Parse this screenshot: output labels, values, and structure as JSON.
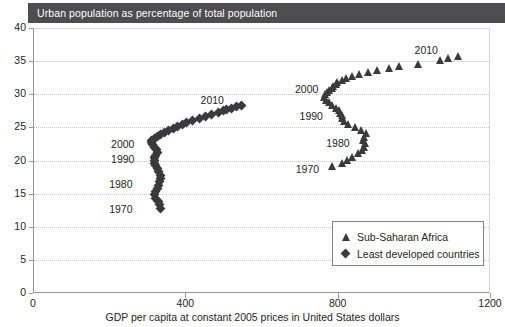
{
  "title_bar": {
    "text": "Urban population as percentage of total population"
  },
  "axis_x_title": "GDP per capita at constant 2005 prices in United States dollars",
  "legend": {
    "items": [
      {
        "symbol": "triangle-marker",
        "label": "Sub-Saharan Africa"
      },
      {
        "symbol": "diamond-marker",
        "label": "Least developed countries"
      }
    ]
  },
  "annotations": {
    "ldc": [
      {
        "label": "2010"
      },
      {
        "label": "2000"
      },
      {
        "label": "1990"
      },
      {
        "label": "1980"
      },
      {
        "label": "1970"
      }
    ],
    "ssa": [
      {
        "label": "2010"
      },
      {
        "label": "2000"
      },
      {
        "label": "1990"
      },
      {
        "label": "1980"
      },
      {
        "label": "1970"
      }
    ]
  },
  "ticks": {
    "y": [
      "0",
      "5",
      "10",
      "15",
      "20",
      "25",
      "30",
      "35",
      "40"
    ],
    "x": [
      "0",
      "400",
      "800",
      "1200"
    ]
  },
  "colors": {
    "title_bar_bg": "#4d4d4f",
    "title_bar_fg": "#ffffff",
    "marker": "#3a3a3c",
    "axis": "#939598",
    "gridline": "#c7c7c7",
    "legend_border": "#808285",
    "plot_bg": "#ffffff"
  },
  "chart_data": {
    "type": "scatter",
    "title": "Urban population as percentage of total population",
    "xlabel": "GDP per capita at constant 2005 prices in United States dollars",
    "ylabel": "Urban population as percentage of total population",
    "xlim": [
      0,
      1200
    ],
    "ylim": [
      0,
      40
    ],
    "xticks": [
      0,
      400,
      800,
      1200
    ],
    "yticks": [
      0,
      5,
      10,
      15,
      20,
      25,
      30,
      35,
      40
    ],
    "grid": true,
    "legend_position": "lower-right",
    "series": [
      {
        "name": "Sub-Saharan Africa",
        "marker": "triangle",
        "color": "#3a3a3c",
        "points": [
          {
            "year": 1970,
            "x": 788,
            "y": 19.1
          },
          {
            "year": 1971,
            "x": 812,
            "y": 19.6
          },
          {
            "year": 1972,
            "x": 826,
            "y": 20.1
          },
          {
            "year": 1973,
            "x": 840,
            "y": 20.6
          },
          {
            "year": 1974,
            "x": 856,
            "y": 21.1
          },
          {
            "year": 1975,
            "x": 866,
            "y": 21.6
          },
          {
            "year": 1976,
            "x": 872,
            "y": 22.1
          },
          {
            "year": 1977,
            "x": 874,
            "y": 22.6
          },
          {
            "year": 1978,
            "x": 868,
            "y": 23.1
          },
          {
            "year": 1979,
            "x": 872,
            "y": 23.6
          },
          {
            "year": 1980,
            "x": 876,
            "y": 24.1
          },
          {
            "year": 1981,
            "x": 862,
            "y": 24.6
          },
          {
            "year": 1982,
            "x": 848,
            "y": 25.1
          },
          {
            "year": 1983,
            "x": 830,
            "y": 25.5
          },
          {
            "year": 1984,
            "x": 818,
            "y": 26.0
          },
          {
            "year": 1985,
            "x": 812,
            "y": 26.4
          },
          {
            "year": 1986,
            "x": 812,
            "y": 26.8
          },
          {
            "year": 1987,
            "x": 808,
            "y": 27.2
          },
          {
            "year": 1988,
            "x": 806,
            "y": 27.6
          },
          {
            "year": 1989,
            "x": 796,
            "y": 28.0
          },
          {
            "year": 1990,
            "x": 786,
            "y": 28.4
          },
          {
            "year": 1991,
            "x": 778,
            "y": 28.8
          },
          {
            "year": 1992,
            "x": 770,
            "y": 29.2
          },
          {
            "year": 1993,
            "x": 766,
            "y": 29.6
          },
          {
            "year": 1994,
            "x": 768,
            "y": 30.0
          },
          {
            "year": 1995,
            "x": 774,
            "y": 30.4
          },
          {
            "year": 1996,
            "x": 780,
            "y": 30.7
          },
          {
            "year": 1997,
            "x": 786,
            "y": 31.0
          },
          {
            "year": 1998,
            "x": 790,
            "y": 31.3
          },
          {
            "year": 1999,
            "x": 796,
            "y": 31.6
          },
          {
            "year": 2000,
            "x": 800,
            "y": 31.9
          },
          {
            "year": 2001,
            "x": 812,
            "y": 32.2
          },
          {
            "year": 2002,
            "x": 824,
            "y": 32.5
          },
          {
            "year": 2003,
            "x": 838,
            "y": 32.8
          },
          {
            "year": 2004,
            "x": 858,
            "y": 33.1
          },
          {
            "year": 2005,
            "x": 880,
            "y": 33.4
          },
          {
            "year": 2006,
            "x": 906,
            "y": 33.7
          },
          {
            "year": 2007,
            "x": 936,
            "y": 34.0
          },
          {
            "year": 2008,
            "x": 962,
            "y": 34.3
          },
          {
            "year": 2009,
            "x": 1012,
            "y": 34.6
          },
          {
            "year": 2010,
            "x": 1070,
            "y": 35.1
          },
          {
            "year": 2011,
            "x": 1092,
            "y": 35.4
          },
          {
            "year": 2012,
            "x": 1118,
            "y": 35.7
          }
        ]
      },
      {
        "name": "Least developed countries",
        "marker": "diamond",
        "color": "#3a3a3c",
        "points": [
          {
            "year": 1970,
            "x": 336,
            "y": 12.8
          },
          {
            "year": 1971,
            "x": 332,
            "y": 13.3
          },
          {
            "year": 1972,
            "x": 330,
            "y": 13.8
          },
          {
            "year": 1973,
            "x": 322,
            "y": 14.3
          },
          {
            "year": 1974,
            "x": 320,
            "y": 14.8
          },
          {
            "year": 1975,
            "x": 322,
            "y": 15.3
          },
          {
            "year": 1976,
            "x": 326,
            "y": 15.8
          },
          {
            "year": 1977,
            "x": 330,
            "y": 16.3
          },
          {
            "year": 1978,
            "x": 332,
            "y": 16.8
          },
          {
            "year": 1979,
            "x": 334,
            "y": 17.3
          },
          {
            "year": 1980,
            "x": 334,
            "y": 17.8
          },
          {
            "year": 1981,
            "x": 330,
            "y": 18.3
          },
          {
            "year": 1982,
            "x": 326,
            "y": 18.8
          },
          {
            "year": 1983,
            "x": 322,
            "y": 19.2
          },
          {
            "year": 1984,
            "x": 318,
            "y": 19.6
          },
          {
            "year": 1985,
            "x": 318,
            "y": 20.0
          },
          {
            "year": 1986,
            "x": 320,
            "y": 20.4
          },
          {
            "year": 1987,
            "x": 322,
            "y": 20.8
          },
          {
            "year": 1988,
            "x": 326,
            "y": 21.2
          },
          {
            "year": 1989,
            "x": 324,
            "y": 21.6
          },
          {
            "year": 1990,
            "x": 320,
            "y": 22.0
          },
          {
            "year": 1991,
            "x": 314,
            "y": 22.4
          },
          {
            "year": 1992,
            "x": 310,
            "y": 22.7
          },
          {
            "year": 1993,
            "x": 312,
            "y": 23.0
          },
          {
            "year": 1994,
            "x": 318,
            "y": 23.3
          },
          {
            "year": 1995,
            "x": 326,
            "y": 23.6
          },
          {
            "year": 1996,
            "x": 336,
            "y": 23.9
          },
          {
            "year": 1997,
            "x": 346,
            "y": 24.2
          },
          {
            "year": 1998,
            "x": 356,
            "y": 24.5
          },
          {
            "year": 1999,
            "x": 368,
            "y": 24.8
          },
          {
            "year": 2000,
            "x": 380,
            "y": 25.1
          },
          {
            "year": 2001,
            "x": 392,
            "y": 25.4
          },
          {
            "year": 2002,
            "x": 404,
            "y": 25.7
          },
          {
            "year": 2003,
            "x": 420,
            "y": 26.0
          },
          {
            "year": 2004,
            "x": 436,
            "y": 26.3
          },
          {
            "year": 2005,
            "x": 452,
            "y": 26.6
          },
          {
            "year": 2006,
            "x": 468,
            "y": 26.9
          },
          {
            "year": 2007,
            "x": 486,
            "y": 27.2
          },
          {
            "year": 2008,
            "x": 500,
            "y": 27.5
          },
          {
            "year": 2009,
            "x": 508,
            "y": 27.7
          },
          {
            "year": 2010,
            "x": 520,
            "y": 27.9
          },
          {
            "year": 2011,
            "x": 534,
            "y": 28.1
          },
          {
            "year": 2012,
            "x": 548,
            "y": 28.3
          }
        ]
      }
    ],
    "annotations": [
      {
        "series": "Least developed countries",
        "label": "1970",
        "x": 200,
        "y": 12.6
      },
      {
        "series": "Least developed countries",
        "label": "1980",
        "x": 200,
        "y": 16.3
      },
      {
        "series": "Least developed countries",
        "label": "1990",
        "x": 205,
        "y": 20.1
      },
      {
        "series": "Least developed countries",
        "label": "2000",
        "x": 205,
        "y": 22.4
      },
      {
        "series": "Least developed countries",
        "label": "2010",
        "x": 440,
        "y": 29.0
      },
      {
        "series": "Sub-Saharan Africa",
        "label": "1970",
        "x": 690,
        "y": 18.6
      },
      {
        "series": "Sub-Saharan Africa",
        "label": "1980",
        "x": 770,
        "y": 22.5
      },
      {
        "series": "Sub-Saharan Africa",
        "label": "1990",
        "x": 700,
        "y": 26.5
      },
      {
        "series": "Sub-Saharan Africa",
        "label": "2000",
        "x": 688,
        "y": 30.6
      },
      {
        "series": "Sub-Saharan Africa",
        "label": "2010",
        "x": 1002,
        "y": 36.6
      }
    ]
  }
}
